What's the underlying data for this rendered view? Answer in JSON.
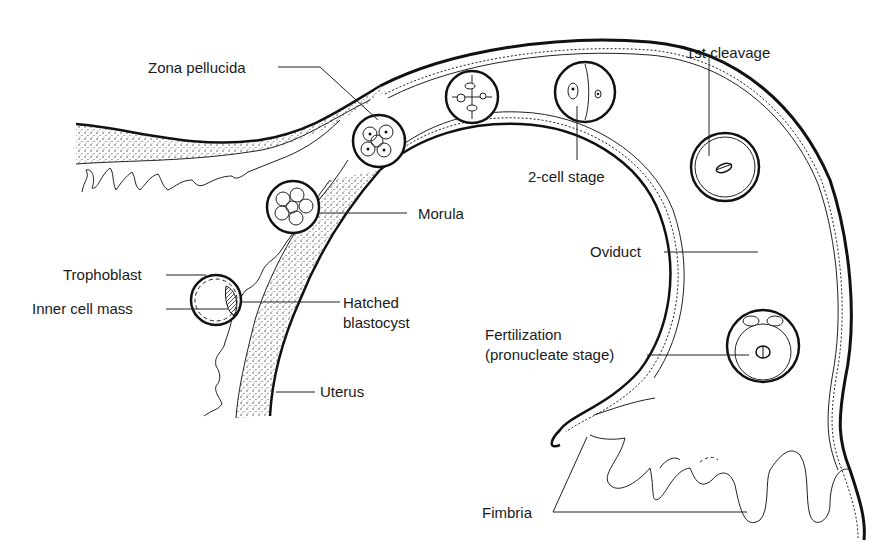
{
  "diagram": {
    "type": "anatomical-illustration",
    "labels": {
      "zona_pellucida": "Zona pellucida",
      "first_cleavage": "1st cleavage",
      "two_cell_stage": "2-cell stage",
      "morula": "Morula",
      "oviduct": "Oviduct",
      "trophoblast": "Trophoblast",
      "inner_cell_mass": "Inner cell mass",
      "hatched_line1": "Hatched",
      "hatched_line2": "blastocyst",
      "uterus": "Uterus",
      "fertilization_line1": "Fertilization",
      "fertilization_line2": "(pronucleate stage)",
      "fimbria": "Fimbria"
    },
    "stages_sequence": [
      "Fertilization (pronucleate stage)",
      "1st cleavage",
      "2-cell stage",
      "4-cell stage",
      "Zona pellucida (8-cell)",
      "Morula",
      "Hatched blastocyst"
    ],
    "colors": {
      "line": "#111111",
      "background": "#ffffff",
      "text": "#1a1a1a"
    }
  }
}
